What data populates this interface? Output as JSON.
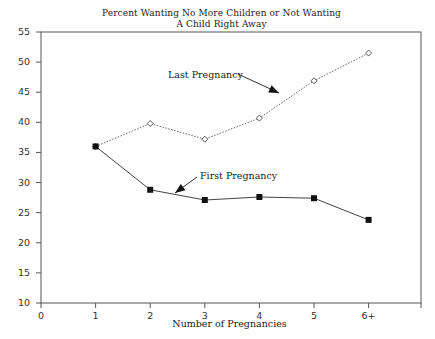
{
  "chart_data": {
    "type": "line",
    "title_lines": [
      "Percent Wanting No More Children or Not Wanting",
      "A Child Right Away"
    ],
    "xlabel": "Number of Pregnancies",
    "ylabel": "",
    "x_ticks": [
      "0",
      "1",
      "2",
      "3",
      "4",
      "5",
      "6+"
    ],
    "y_ticks": [
      "55",
      "50",
      "45",
      "40",
      "35",
      "30",
      "25",
      "20",
      "15",
      "10"
    ],
    "xlim": [
      0,
      7
    ],
    "ylim": [
      10,
      55
    ],
    "grid": false,
    "legend": "none (inline annotations with arrows)",
    "categories": [
      "1",
      "2",
      "3",
      "4",
      "5",
      "6+"
    ],
    "series": [
      {
        "name": "Last Pregnancy",
        "style": "dotted line, hollow diamond markers",
        "values": [
          36.0,
          39.8,
          37.2,
          40.7,
          46.9,
          51.5
        ]
      },
      {
        "name": "First Pregnancy",
        "style": "solid line, filled square markers",
        "values": [
          36.0,
          28.8,
          27.1,
          27.6,
          27.4,
          23.8
        ]
      }
    ],
    "annotations": [
      {
        "text": "Last Pregnancy",
        "arrow_to_series": "Last Pregnancy"
      },
      {
        "text": "First Pregnancy",
        "arrow_to_series": "First Pregnancy"
      }
    ]
  }
}
